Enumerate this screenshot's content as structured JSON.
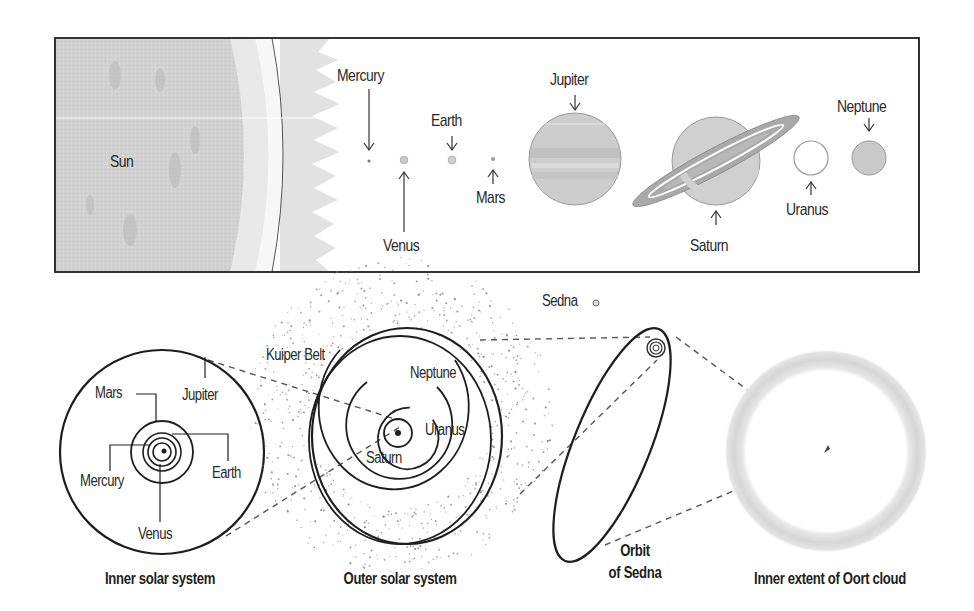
{
  "top_panel": {
    "sun_label": "Sun",
    "planets": [
      {
        "name": "Mercury",
        "label": "Mercury"
      },
      {
        "name": "Venus",
        "label": "Venus"
      },
      {
        "name": "Earth",
        "label": "Earth"
      },
      {
        "name": "Mars",
        "label": "Mars"
      },
      {
        "name": "Jupiter",
        "label": "Jupiter"
      },
      {
        "name": "Saturn",
        "label": "Saturn"
      },
      {
        "name": "Uranus",
        "label": "Uranus"
      },
      {
        "name": "Neptune",
        "label": "Neptune"
      }
    ]
  },
  "inner_system": {
    "caption": "Inner solar system",
    "labels": {
      "mars": "Mars",
      "jupiter": "Jupiter",
      "mercury": "Mercury",
      "earth": "Earth",
      "venus": "Venus"
    }
  },
  "outer_system": {
    "caption": "Outer solar system",
    "labels": {
      "kuiper": "Kuiper Belt",
      "neptune": "Neptune",
      "uranus": "Uranus",
      "saturn": "Saturn"
    }
  },
  "sedna": {
    "label": "Sedna",
    "caption_line1": "Orbit",
    "caption_line2": "of Sedna"
  },
  "oort": {
    "caption": "Inner extent of Oort cloud"
  },
  "colors": {
    "sun_fill": "#d4d4d4",
    "planet_fill": "#cfcfcf",
    "line": "#222222",
    "oort_ring": "#d8d8d8"
  }
}
